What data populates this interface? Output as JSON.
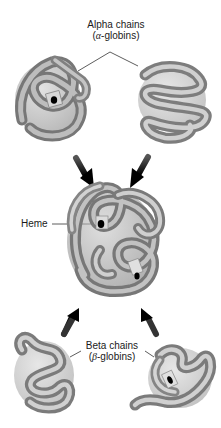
{
  "diagram": {
    "labels": {
      "alpha_line1": "Alpha chains",
      "alpha_line2_prefix": "(",
      "alpha_symbol": "α",
      "alpha_line2_suffix": "-globins)",
      "heme": "Heme",
      "beta_line1": "Beta chains",
      "beta_line2_prefix": "(",
      "beta_symbol": "β",
      "beta_line2_suffix": "-globins)"
    },
    "components": [
      {
        "id": "alpha-chain-left",
        "type": "alpha-globin",
        "has_heme": true
      },
      {
        "id": "alpha-chain-right",
        "type": "alpha-globin",
        "has_heme": false
      },
      {
        "id": "hemoglobin-tetramer",
        "type": "assembled",
        "has_heme": true
      },
      {
        "id": "beta-chain-left",
        "type": "beta-globin",
        "has_heme": false
      },
      {
        "id": "beta-chain-right",
        "type": "beta-globin",
        "has_heme": true
      }
    ],
    "arrows": [
      {
        "from": "alpha-chain-left",
        "to": "hemoglobin-tetramer"
      },
      {
        "from": "alpha-chain-right",
        "to": "hemoglobin-tetramer"
      },
      {
        "from": "beta-chain-left",
        "to": "hemoglobin-tetramer"
      },
      {
        "from": "beta-chain-right",
        "to": "hemoglobin-tetramer"
      }
    ],
    "colors": {
      "tube_dark": "#6e6e6e",
      "tube_mid": "#a0a0a0",
      "tube_light": "#d8d8d8",
      "arrow": "#111111",
      "heme": "#000000",
      "text": "#1a1a1a"
    }
  }
}
